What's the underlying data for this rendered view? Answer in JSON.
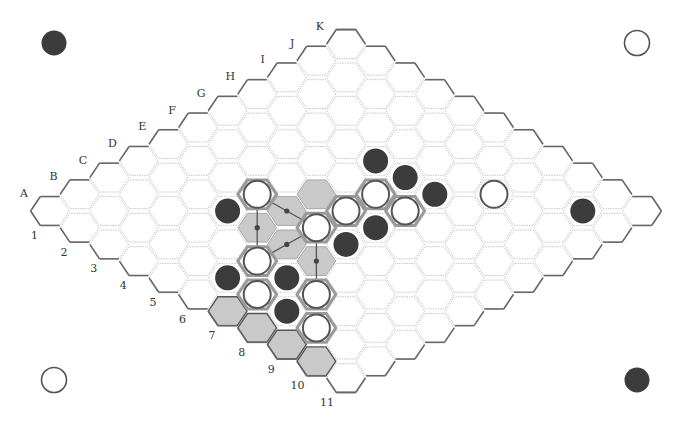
{
  "figure": {
    "board_size": 11,
    "column_labels": [
      "A",
      "B",
      "C",
      "D",
      "E",
      "F",
      "G",
      "H",
      "I",
      "J",
      "K"
    ],
    "row_labels": [
      "1",
      "2",
      "3",
      "4",
      "5",
      "6",
      "7",
      "8",
      "9",
      "10",
      "11"
    ],
    "colors": {
      "black_stone": "#3c3c3c",
      "white_stone": "#ffffff",
      "shade": "#c9c9c9",
      "grid": "#b8b8b8",
      "border": "#666666"
    },
    "corner_markers": [
      {
        "position": "top-left",
        "color": "black",
        "x": 54,
        "y": 43
      },
      {
        "position": "top-right",
        "color": "white",
        "x": 637,
        "y": 43
      },
      {
        "position": "bottom-left",
        "color": "white",
        "x": 54,
        "y": 380
      },
      {
        "position": "bottom-right",
        "color": "black",
        "x": 637,
        "y": 380
      }
    ],
    "stones": [
      {
        "cell": "E4",
        "color": "white",
        "halo": true
      },
      {
        "cell": "D4",
        "color": "black"
      },
      {
        "cell": "E6",
        "color": "white",
        "halo": true
      },
      {
        "cell": "C6",
        "color": "white",
        "halo": true
      },
      {
        "cell": "B6",
        "color": "black"
      },
      {
        "cell": "C7",
        "color": "black"
      },
      {
        "cell": "B7",
        "color": "white",
        "halo": true
      },
      {
        "cell": "C8",
        "color": "white",
        "halo": true
      },
      {
        "cell": "B8",
        "color": "black"
      },
      {
        "cell": "B9",
        "color": "white",
        "halo": true
      },
      {
        "cell": "F6",
        "color": "white",
        "halo": true
      },
      {
        "cell": "E7",
        "color": "black"
      },
      {
        "cell": "G6",
        "color": "white",
        "halo": true
      },
      {
        "cell": "F7",
        "color": "black"
      },
      {
        "cell": "H5",
        "color": "black"
      },
      {
        "cell": "H6",
        "color": "black"
      },
      {
        "cell": "G7",
        "color": "white",
        "halo": true
      },
      {
        "cell": "H7",
        "color": "black"
      },
      {
        "cell": "I8",
        "color": "white"
      },
      {
        "cell": "J10",
        "color": "black"
      }
    ],
    "shaded_cells": [
      "D5",
      "E5",
      "D6",
      "D7",
      "F5"
    ],
    "edge_template_cells": [
      "A7",
      "A8",
      "A9",
      "A10"
    ],
    "links": [
      {
        "from": "E4",
        "to": "C6",
        "via": "D5"
      },
      {
        "from": "E4",
        "to": "E6",
        "via": "E5"
      },
      {
        "from": "C6",
        "to": "E6",
        "via": "D6"
      },
      {
        "from": "E6",
        "to": "C8",
        "via": "D7"
      }
    ]
  }
}
